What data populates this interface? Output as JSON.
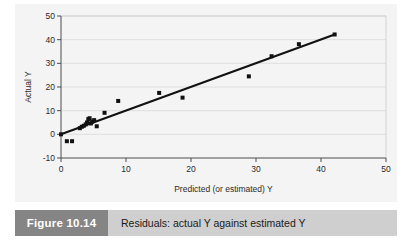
{
  "figure": {
    "number_label": "Figure 10.14",
    "caption": "Residuals: actual Y against estimated Y"
  },
  "colors": {
    "panel_background": "#f4f4f4",
    "page_background": "#ffffff",
    "caption_bar": "#cfcfcf",
    "figure_number_box": "#858585",
    "figure_number_text": "#ffffff",
    "axis": "#4d4d4d",
    "gridline": "#d9d9d9",
    "marker": "#111111",
    "fit_line": "#111111"
  },
  "chart_data": {
    "type": "scatter",
    "title": "",
    "subtitle": "",
    "xlabel": "Predicted (or estimated) Y",
    "ylabel": "Actual Y",
    "xlim": [
      0,
      50
    ],
    "ylim": [
      -10,
      50
    ],
    "xticks": [
      0,
      10,
      20,
      30,
      40,
      50
    ],
    "xtick_labels": [
      "0",
      "10",
      "20",
      "30",
      "40",
      "50"
    ],
    "yticks": [
      -10,
      0,
      10,
      20,
      30,
      40,
      50
    ],
    "ytick_labels": [
      "-10",
      "0",
      "10",
      "20",
      "30",
      "40",
      "50"
    ],
    "grid": "horizontal",
    "legend": null,
    "legend_position": "none",
    "marker_shape": "square",
    "marker_size_px": 4,
    "series": [
      {
        "name": "Actual vs predicted Y",
        "points": [
          [
            0.0,
            0.0
          ],
          [
            0.9,
            -2.9
          ],
          [
            1.7,
            -2.9
          ],
          [
            2.9,
            2.6
          ],
          [
            3.2,
            3.2
          ],
          [
            3.5,
            3.6
          ],
          [
            3.8,
            4.2
          ],
          [
            4.0,
            5.0
          ],
          [
            4.2,
            6.4
          ],
          [
            4.4,
            6.8
          ],
          [
            4.6,
            4.6
          ],
          [
            4.8,
            5.4
          ],
          [
            5.1,
            6.0
          ],
          [
            5.5,
            3.4
          ],
          [
            6.7,
            9.1
          ],
          [
            8.8,
            14.1
          ],
          [
            15.1,
            17.5
          ],
          [
            18.7,
            15.5
          ],
          [
            28.9,
            24.5
          ],
          [
            32.4,
            33.0
          ],
          [
            36.6,
            38.1
          ],
          [
            42.1,
            42.2
          ]
        ]
      }
    ],
    "fit_line": {
      "name": "regression fit",
      "x_start": 0.0,
      "y_start": 0.0,
      "x_end": 42.1,
      "y_end": 42.2
    }
  }
}
